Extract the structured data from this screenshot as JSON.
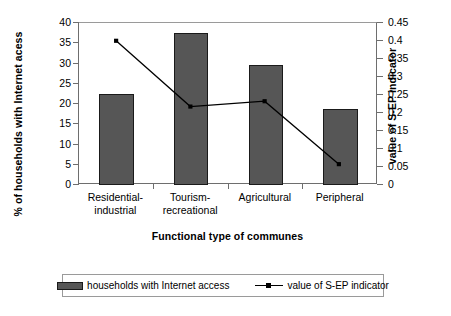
{
  "chart_data": {
    "type": "bar",
    "title": "",
    "subtitle": "",
    "categories": [
      "Residential-industrial",
      "Tourism-recreational",
      "Agricultural",
      "Peripheral"
    ],
    "category_lines": [
      [
        "Residential-",
        "industrial"
      ],
      [
        "Tourism-",
        "recreational"
      ],
      [
        "Agricultural",
        ""
      ],
      [
        "Peripheral",
        ""
      ]
    ],
    "xlabel": "Functional type of communes",
    "ylabel": "% of households with Internet acess",
    "ylabel_secondary": "value of S-EP indicator",
    "ylim": [
      0,
      40
    ],
    "ylim_secondary": [
      0,
      0.45
    ],
    "yticks": [
      0,
      5,
      10,
      15,
      20,
      25,
      30,
      35,
      40
    ],
    "ytick_labels": [
      "0",
      "5",
      "10",
      "15",
      "20",
      "25",
      "30",
      "35",
      "40"
    ],
    "yticks_secondary": [
      0,
      0.05,
      0.1,
      0.15,
      0.2,
      0.25,
      0.3,
      0.35,
      0.4,
      0.45
    ],
    "ytick_labels_secondary": [
      "0",
      "0.05",
      "0.1",
      "0.15",
      "0.2",
      "0.25",
      "0.3",
      "0.35",
      "0.4",
      "0.45"
    ],
    "grid": false,
    "legend_position": "bottom",
    "series": [
      {
        "name": "households with Internet access",
        "type": "bar",
        "axis": "left",
        "color": "#565656",
        "values": [
          22.5,
          37.5,
          29.6,
          18.8
        ]
      },
      {
        "name": "value of S-EP indicator",
        "type": "line",
        "axis": "right",
        "color": "#000000",
        "values": [
          0.4,
          0.215,
          0.23,
          0.053
        ]
      }
    ]
  },
  "legend": {
    "bar_label": "households with Internet access",
    "line_label": "value of S-EP indicator"
  }
}
